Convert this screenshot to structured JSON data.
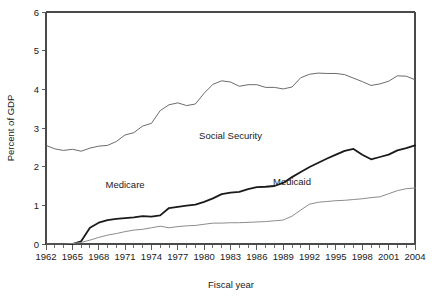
{
  "chart_data": {
    "type": "line",
    "title": "",
    "xlabel": "Fiscal year",
    "ylabel": "Percent of GDP",
    "xlim": [
      1962,
      2004
    ],
    "ylim": [
      0,
      6
    ],
    "ytick_step": 1,
    "xtick_step": 3,
    "xminor_step": 1,
    "grid": false,
    "legend": "inline-annotations",
    "yticks": [
      "0",
      "1",
      "2",
      "3",
      "4",
      "5",
      "6"
    ],
    "xticks": [
      "1962",
      "1965",
      "1968",
      "1971",
      "1974",
      "1977",
      "1980",
      "1983",
      "1986",
      "1989",
      "1992",
      "1995",
      "1998",
      "2001",
      "2004"
    ],
    "x": [
      1962,
      1963,
      1964,
      1965,
      1966,
      1967,
      1968,
      1969,
      1970,
      1971,
      1972,
      1973,
      1974,
      1975,
      1976,
      1977,
      1978,
      1979,
      1980,
      1981,
      1982,
      1983,
      1984,
      1985,
      1986,
      1987,
      1988,
      1989,
      1990,
      1991,
      1992,
      1993,
      1994,
      1995,
      1996,
      1997,
      1998,
      1999,
      2000,
      2001,
      2002,
      2003,
      2004
    ],
    "series": [
      {
        "name": "Social Security",
        "color": "#5a5a5a",
        "width": 0.9,
        "label_x": 1983,
        "label_y": 2.72,
        "values": [
          2.55,
          2.46,
          2.42,
          2.45,
          2.4,
          2.48,
          2.53,
          2.55,
          2.65,
          2.82,
          2.88,
          3.05,
          3.12,
          3.45,
          3.6,
          3.65,
          3.58,
          3.62,
          3.9,
          4.13,
          4.22,
          4.19,
          4.08,
          4.12,
          4.12,
          4.05,
          4.05,
          4.01,
          4.06,
          4.3,
          4.39,
          4.42,
          4.41,
          4.41,
          4.38,
          4.29,
          4.2,
          4.1,
          4.14,
          4.21,
          4.35,
          4.34,
          4.25
        ]
      },
      {
        "name": "Medicare",
        "color": "#1a1a1a",
        "width": 1.8,
        "label_x": 1971,
        "label_y": 1.44,
        "values": [
          0.0,
          0.0,
          0.0,
          0.0,
          0.07,
          0.42,
          0.55,
          0.62,
          0.65,
          0.67,
          0.69,
          0.72,
          0.71,
          0.74,
          0.93,
          0.96,
          0.99,
          1.02,
          1.09,
          1.18,
          1.29,
          1.33,
          1.35,
          1.42,
          1.47,
          1.48,
          1.5,
          1.58,
          1.73,
          1.86,
          1.99,
          2.1,
          2.21,
          2.31,
          2.41,
          2.46,
          2.31,
          2.19,
          2.25,
          2.31,
          2.42,
          2.48,
          2.55
        ]
      },
      {
        "name": "Medicaid",
        "color": "#8c8c8c",
        "width": 1.0,
        "label_x": 1990,
        "label_y": 1.53,
        "values": [
          0.0,
          0.0,
          0.0,
          0.01,
          0.04,
          0.1,
          0.17,
          0.23,
          0.27,
          0.32,
          0.36,
          0.38,
          0.42,
          0.46,
          0.42,
          0.45,
          0.47,
          0.48,
          0.51,
          0.54,
          0.54,
          0.55,
          0.55,
          0.56,
          0.57,
          0.58,
          0.6,
          0.62,
          0.72,
          0.88,
          1.03,
          1.08,
          1.1,
          1.12,
          1.13,
          1.15,
          1.17,
          1.2,
          1.22,
          1.3,
          1.38,
          1.43,
          1.45
        ]
      }
    ]
  }
}
